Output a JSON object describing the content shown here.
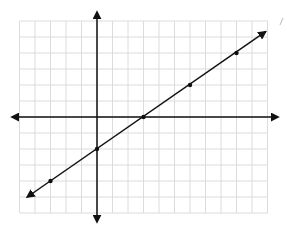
{
  "chart_data": {
    "type": "line",
    "title": "",
    "xlabel": "",
    "ylabel": "",
    "grid": true,
    "xlim": [
      -5,
      11
    ],
    "ylim": [
      -6,
      6
    ],
    "axes": {
      "x_axis_arrows": true,
      "y_axis_arrows": true
    },
    "line": {
      "slope": 0.6667,
      "intercept": -2,
      "equation": "y = (2/3)x - 2",
      "arrows_both_ends": true,
      "from": [
        -4.5,
        -5
      ],
      "to": [
        11,
        5.33
      ]
    },
    "points": [
      {
        "x": -3,
        "y": -4
      },
      {
        "x": 0,
        "y": -2
      },
      {
        "x": 3,
        "y": 0
      },
      {
        "x": 6,
        "y": 2
      },
      {
        "x": 9,
        "y": 4
      }
    ]
  },
  "colors": {
    "grid": "#dcdcdc",
    "axis": "#111111",
    "line": "#111111",
    "background": "#ffffff"
  },
  "layout": {
    "origin_px": [
      97,
      117
    ],
    "unit_px_x": 15.5,
    "unit_px_y": 16,
    "grid_left": 20,
    "grid_right": 268,
    "grid_top": 21,
    "grid_bottom": 213
  }
}
